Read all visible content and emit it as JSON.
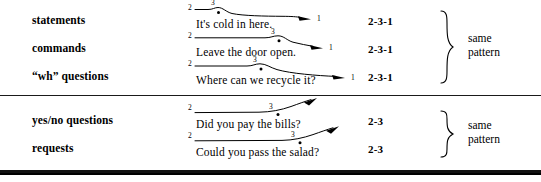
{
  "figure": {
    "sections": [
      {
        "id": "falling-intonation",
        "pattern_label": "same\npattern",
        "brace_line1": "same",
        "brace_line2": "pattern",
        "rows": [
          {
            "category": "statements",
            "example": "It's cold in here.",
            "pattern_code": "2-3-1",
            "start_tone": "2",
            "peak_tone": "3",
            "end_tone": "1",
            "contour": "rise-fall"
          },
          {
            "category": "commands",
            "example": "Leave the door open.",
            "pattern_code": "2-3-1",
            "start_tone": "2",
            "peak_tone": "3",
            "end_tone": "1",
            "contour": "rise-fall"
          },
          {
            "category": "“wh” questions",
            "example": "Where can we recycle it?",
            "pattern_code": "2-3-1",
            "start_tone": "2",
            "peak_tone": "3",
            "end_tone": "1",
            "contour": "rise-fall"
          }
        ]
      },
      {
        "id": "rising-intonation",
        "pattern_label": "same\npattern",
        "brace_line1": "same",
        "brace_line2": "pattern",
        "rows": [
          {
            "category": "yes/no questions",
            "example": "Did you pay the bills?",
            "pattern_code": "2-3",
            "start_tone": "2",
            "peak_tone": "3",
            "end_tone": "",
            "contour": "rise"
          },
          {
            "category": "requests",
            "example": "Could you pass the salad?",
            "pattern_code": "2-3",
            "start_tone": "2",
            "peak_tone": "3",
            "end_tone": "",
            "contour": "rise"
          }
        ]
      }
    ]
  },
  "colors": {
    "ink": "#000000",
    "rule": "#1a1a1a",
    "background": "#ffffff"
  }
}
